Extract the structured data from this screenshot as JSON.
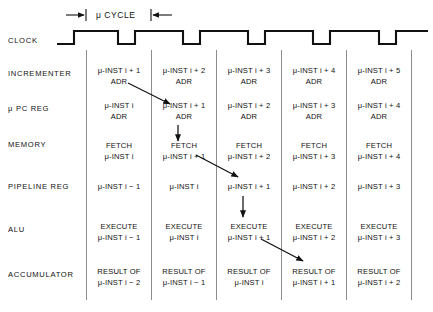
{
  "figure": {
    "cycle_label": "μ CYCLE",
    "clock_label": "CLOCK"
  },
  "rows": [
    {
      "name": "incrementer",
      "label": "INCREMENTER",
      "cells": [
        {
          "l1": "μ-INST i + 1",
          "l2": "ADR"
        },
        {
          "l1": "μ-INST i + 2",
          "l2": "ADR"
        },
        {
          "l1": "μ-INST i + 3",
          "l2": "ADR"
        },
        {
          "l1": "μ-INST i + 4",
          "l2": "ADR"
        },
        {
          "l1": "μ-INST i + 5",
          "l2": "ADR"
        }
      ]
    },
    {
      "name": "u-pc-reg",
      "label": "μ PC REG",
      "cells": [
        {
          "l1": "μ-INST i",
          "l2": "ADR"
        },
        {
          "l1": "μ-INST i + 1",
          "l2": "ADR"
        },
        {
          "l1": "μ-INST i + 2",
          "l2": "ADR"
        },
        {
          "l1": "μ-INST i + 3",
          "l2": "ADR"
        },
        {
          "l1": "μ-INST i + 4",
          "l2": "ADR"
        }
      ]
    },
    {
      "name": "memory",
      "label": "MEMORY",
      "cells": [
        {
          "l1": "FETCH",
          "l2": "μ-INST i"
        },
        {
          "l1": "FETCH",
          "l2": "μ-INST i + 1"
        },
        {
          "l1": "FETCH",
          "l2": "μ-INST i + 2"
        },
        {
          "l1": "FETCH",
          "l2": "μ-INST i + 3"
        },
        {
          "l1": "FETCH",
          "l2": "μ-INST i + 4"
        }
      ]
    },
    {
      "name": "pipeline-reg",
      "label": "PIPELINE REG",
      "cells": [
        {
          "l1": "μ-INST i − 1",
          "l2": ""
        },
        {
          "l1": "μ-INST i",
          "l2": ""
        },
        {
          "l1": "μ-INST i + 1",
          "l2": ""
        },
        {
          "l1": "μ-INST i + 2",
          "l2": ""
        },
        {
          "l1": "μ-INST i + 3",
          "l2": ""
        }
      ]
    },
    {
      "name": "alu",
      "label": "ALU",
      "cells": [
        {
          "l1": "EXECUTE",
          "l2": "μ-INST i − 1"
        },
        {
          "l1": "EXECUTE",
          "l2": "μ-INST i"
        },
        {
          "l1": "EXECUTE",
          "l2": "μ-INST i + 1"
        },
        {
          "l1": "EXECUTE",
          "l2": "μ-INST i + 2"
        },
        {
          "l1": "EXECUTE",
          "l2": "μ-INST i + 3"
        }
      ]
    },
    {
      "name": "accumulator",
      "label": "ACCUMULATOR",
      "cells": [
        {
          "l1": "RESULT OF",
          "l2": "μ-INST i − 2"
        },
        {
          "l1": "RESULT OF",
          "l2": "μ-INST i − 1"
        },
        {
          "l1": "RESULT OF",
          "l2": "μ-INST i"
        },
        {
          "l1": "RESULT OF",
          "l2": "μ-INST i + 1"
        },
        {
          "l1": "RESULT OF",
          "l2": "μ-INST i + 2"
        }
      ]
    }
  ],
  "colors": {
    "ink": "#111111",
    "grid": "#8d8d8d",
    "background": "#ffffff"
  }
}
